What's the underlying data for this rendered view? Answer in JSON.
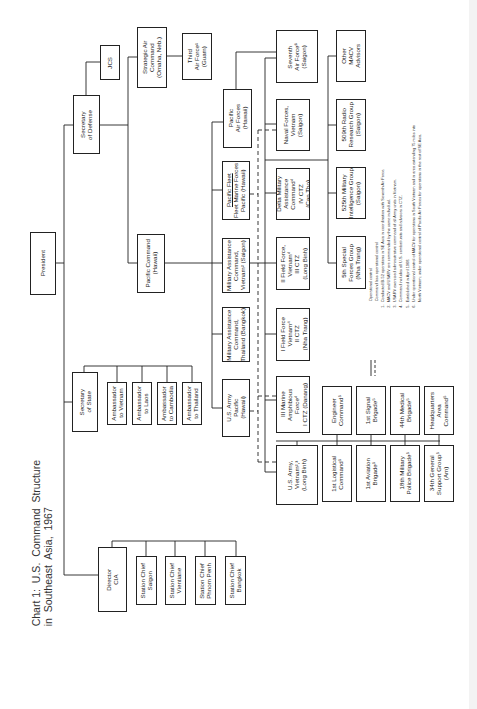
{
  "title": "Chart 1:  U.S.  Command  Structure\nin  Southeast  Asia,  1967",
  "legend": {
    "solid_label": "Operational control",
    "dashed_label": "Command less operational control",
    "notes": [
      "1.  Conducted B-52 operations in SE Asia in coordination with Seventh Air Force.",
      "2.  MACV and USARV are commanded by the same individual.",
      "3.  USARV exercised administrative command of all Army units in Vietnam.",
      "4.  Command includes all U.S. combat units and advisors in CTZ.",
      "5.  Established in April 1968.",
      "6.  Under operational control of MACV for operations in South Vietnam and in area extending 75 miles into\n     North Vietnam; under operational control of Pacific Air Forces for operations in the rest of SE Asia."
    ]
  },
  "boxes": {
    "president": "President",
    "secdef": "Secretary\nof Defense",
    "jcs": "JCS",
    "sac": "Strategic Air\nCommand\n(Omaha, Neb.)",
    "third_af": "Third\nAir Force¹\n(Guam)",
    "pacom": "Pacific Command\n(Hawaii)",
    "secstate": "Secretary\nof State",
    "amb_vietnam": "Ambassador\nto Vietnam",
    "amb_laos": "Ambassador\nto Laos",
    "amb_cambodia": "Ambassador\nto Cambodia",
    "amb_thailand": "Ambassador\nto Thailand",
    "dci": "Director\nCIA",
    "sc_saigon": "Station Chief\nSaigon",
    "sc_vientiane": "Station Chief\nVientiane",
    "sc_phnompenh": "Station Chief\nPhnom Penh",
    "sc_bangkok": "Station Chief\nBangkok",
    "usarpac": "U.S. Army\nPacific\n(Hawaii)",
    "mactha": "Military Assistance\nCommand,\nThailand (Bangkok)",
    "macv": "Military Assistance\nCommand,\nVietnam² (Saigon)",
    "pacflt_title": "Pacific Fleet",
    "pacflt": "Fleet Marine Forces\nPacific (Hawaii)",
    "pacaf": "Pacific\nAir Forces\n(Hawaii)",
    "seventh_af": "Seventh\nAir Force⁶\n(Saigon)",
    "navforv": "Naval Forces,\nVietnam\n(Saigon)",
    "delta_mac": "Delta Military\nAssistance\nCommand⁴\nIV CTZ\n(Can Tho)",
    "iiffv": "II Field Force,\nVietnam⁴\nIII CTZ\n(Long Binh)",
    "iffv": "I Field Force\nVietnam⁴\nII CTZ\n(Nha Trang)",
    "iiimaf": "III Marine\nAmphibious\nForce⁴\nI CTZ (Danang)",
    "usarv": "U.S. Army,\nVietnam²,³\n(Long Binh)",
    "other_macv": "Other\nMACV\nAdvisors",
    "rrg509": "509th Radio\nResearch Group\n(Saigon)",
    "mig525": "525th Military\nIntelligence Group\n(Saigon)",
    "sfg5": "5th Special\nForces Group\n(Nha Trang)",
    "engineer": "Engineer\nCommand⁵",
    "signal1": "1st Signal\nBrigade⁵",
    "medical44": "44th Medical\nBrigade⁵",
    "hqarea": "Headquarters\nArea\nCommand⁵",
    "logistical1": "1st Logistical\nCommand⁵",
    "aviation1": "1st Aviation\nBrigade⁵",
    "mp18": "18th Military\nPolice Brigade⁵",
    "gsg34": "34th General\nSupport Group⁵\n(Am)"
  },
  "colors": {
    "line": "#222222",
    "background": "#ffffff",
    "text": "#1a1a1a"
  }
}
